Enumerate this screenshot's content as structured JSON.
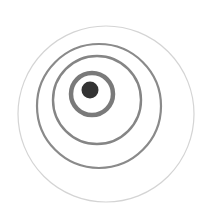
{
  "image": {
    "width": 218,
    "height": 210,
    "background": "#ffffff",
    "description": "Concentric rings around a dark dot, rings offset toward lower-right"
  },
  "rings": [
    {
      "name": "outer-ring",
      "cx": 106,
      "cy": 114,
      "r": 88,
      "stroke": "#d4d4d4",
      "width": 1.2
    },
    {
      "name": "ring-4",
      "cx": 99,
      "cy": 106,
      "r": 62,
      "stroke": "#8a8a8a",
      "width": 2.2
    },
    {
      "name": "ring-3",
      "cx": 97,
      "cy": 100,
      "r": 44,
      "stroke": "#858585",
      "width": 2.4
    },
    {
      "name": "ring-2",
      "cx": 92,
      "cy": 94,
      "r": 21,
      "stroke": "#7a7a7a",
      "width": 4.5
    }
  ],
  "center_dot": {
    "cx": 90,
    "cy": 90,
    "r": 8.5,
    "fill": "#333333"
  }
}
